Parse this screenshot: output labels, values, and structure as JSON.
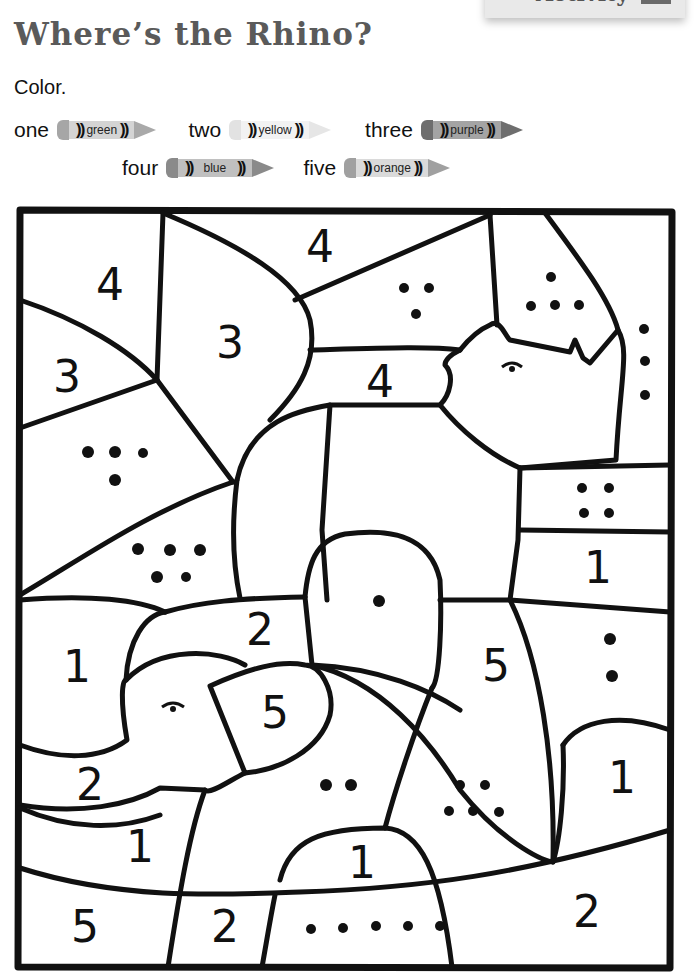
{
  "header": {
    "activity_label": "Activity",
    "activity_badge": "!",
    "title": "Where’s the Rhino?",
    "instruction": "Color."
  },
  "color_key": [
    {
      "number_word": "one",
      "color_name": "green",
      "value": 1,
      "cap": "#a6a6a6",
      "body": "#d4d4d4",
      "tip": "#a9a9a9"
    },
    {
      "number_word": "two",
      "color_name": "yellow",
      "value": 2,
      "cap": "#e2e2e2",
      "body": "#f0f0f0",
      "tip": "#e6e6e6"
    },
    {
      "number_word": "three",
      "color_name": "purple",
      "value": 3,
      "cap": "#6e6e6e",
      "body": "#a4a4a4",
      "tip": "#6e6e6e"
    },
    {
      "number_word": "four",
      "color_name": "blue",
      "value": 4,
      "cap": "#8a8a8a",
      "body": "#c0c0c0",
      "tip": "#8a8a8a"
    },
    {
      "number_word": "five",
      "color_name": "orange",
      "value": 5,
      "cap": "#a0a0a0",
      "body": "#dadada",
      "tip": "#a0a0a0"
    }
  ],
  "crayon_glyph": "))",
  "coloring_page": {
    "stroke_color": "#111111",
    "regions": [
      {
        "id": "top-left",
        "label": "4",
        "type": "numeral"
      },
      {
        "id": "left-upper",
        "label": "3",
        "type": "numeral"
      },
      {
        "id": "upper-center-lobe",
        "label": "3",
        "type": "numeral"
      },
      {
        "id": "top-center",
        "label": "4",
        "type": "numeral"
      },
      {
        "id": "upper-mid-band",
        "label": "4",
        "type": "numeral"
      },
      {
        "id": "upper-right-3dots",
        "label": "3 dots",
        "type": "dots",
        "count": 3
      },
      {
        "id": "horn-5dots",
        "label": "4 dots",
        "type": "dots",
        "count": 4
      },
      {
        "id": "right-edge-3dots",
        "label": "3 dots",
        "type": "dots",
        "count": 3
      },
      {
        "id": "left-mid-4dots",
        "label": "4 dots",
        "type": "dots",
        "count": 4
      },
      {
        "id": "left-lower-5dots",
        "label": "5 dots",
        "type": "dots",
        "count": 5
      },
      {
        "id": "right-4dots",
        "label": "4 dots",
        "type": "dots",
        "count": 4
      },
      {
        "id": "right-band",
        "label": "1",
        "type": "numeral"
      },
      {
        "id": "center-1dot",
        "label": "1 dot",
        "type": "dots",
        "count": 1
      },
      {
        "id": "left-1",
        "label": "1",
        "type": "numeral"
      },
      {
        "id": "elephant-ear",
        "label": "2",
        "type": "numeral"
      },
      {
        "id": "elephant-cheek",
        "label": "5",
        "type": "numeral"
      },
      {
        "id": "center-right-5",
        "label": "5",
        "type": "numeral"
      },
      {
        "id": "right-2dots",
        "label": "2 dots",
        "type": "dots",
        "count": 2
      },
      {
        "id": "left-lower-2",
        "label": "2",
        "type": "numeral"
      },
      {
        "id": "center-2dots",
        "label": "2 dots",
        "type": "dots",
        "count": 2
      },
      {
        "id": "center-5dots",
        "label": "5 dots",
        "type": "dots",
        "count": 5
      },
      {
        "id": "right-lower-1",
        "label": "1",
        "type": "numeral"
      },
      {
        "id": "left-band-1",
        "label": "1",
        "type": "numeral"
      },
      {
        "id": "bottom-center-1",
        "label": "1",
        "type": "numeral"
      },
      {
        "id": "bottom-left-5",
        "label": "5",
        "type": "numeral"
      },
      {
        "id": "bottom-2",
        "label": "2",
        "type": "numeral"
      },
      {
        "id": "bottom-5dots",
        "label": "5 dots",
        "type": "dots",
        "count": 5
      },
      {
        "id": "bottom-right-2",
        "label": "2",
        "type": "numeral"
      }
    ],
    "numerals": {
      "n_top_left": "4",
      "n_left_upper": "3",
      "n_center_lobe": "3",
      "n_top_center": "4",
      "n_mid_band": "4",
      "n_right_band": "1",
      "n_left_1": "1",
      "n_ear_2": "2",
      "n_cheek_5": "5",
      "n_center_5": "5",
      "n_left_lower_2": "2",
      "n_right_lower_1": "1",
      "n_left_band_1": "1",
      "n_bottom_center_1": "1",
      "n_bottom_left_5": "5",
      "n_bottom_2": "2",
      "n_bottom_right_2": "2"
    }
  }
}
